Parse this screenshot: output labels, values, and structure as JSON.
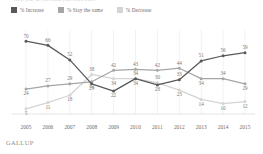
{
  "title_sliver": "Next year, do you think your taxes will...",
  "legend": {
    "items": [
      {
        "label": "% Increase",
        "color": "#595959",
        "name": "increase"
      },
      {
        "label": "% Stay the same",
        "color": "#a6a6a6",
        "name": "stay-the-same"
      },
      {
        "label": "% Decrease",
        "color": "#d4d4d4",
        "name": "decrease"
      }
    ]
  },
  "footer": {
    "brand": "GALLUP"
  },
  "chart_data": {
    "type": "line",
    "title": "",
    "xlabel": "",
    "ylabel": "",
    "categories": [
      "2005",
      "2006",
      "2007",
      "2008",
      "2009",
      "2010",
      "2011",
      "2012",
      "2013",
      "2014",
      "2015"
    ],
    "ylim": [
      0,
      75
    ],
    "grid": "vertical",
    "legend_position": "top-left",
    "series": [
      {
        "name": "% Increase",
        "color": "#595959",
        "values": [
          70,
          66,
          52,
          29,
          22,
          34,
          28,
          33,
          51,
          56,
          59
        ],
        "label_positions": [
          "above",
          "above",
          "above",
          "below",
          "below",
          "above",
          "below",
          "above",
          "above",
          "above",
          "above"
        ]
      },
      {
        "name": "% Stay the same",
        "color": "#a6a6a6",
        "values": [
          24,
          27,
          29,
          31,
          42,
          43,
          42,
          44,
          34,
          34,
          29
        ],
        "label_positions": [
          "below",
          "above",
          "above",
          "below",
          "above",
          "above",
          "above",
          "above",
          "below",
          "above",
          "below"
        ]
      },
      {
        "name": "% Decrease",
        "color": "#d4d4d4",
        "values": [
          5,
          11,
          18,
          38,
          34,
          34,
          30,
          23,
          14,
          10,
          12
        ],
        "label_positions": [
          "below",
          "below",
          "below",
          "above",
          "below",
          "below",
          "above",
          "below",
          "below",
          "below",
          "below"
        ]
      }
    ]
  }
}
